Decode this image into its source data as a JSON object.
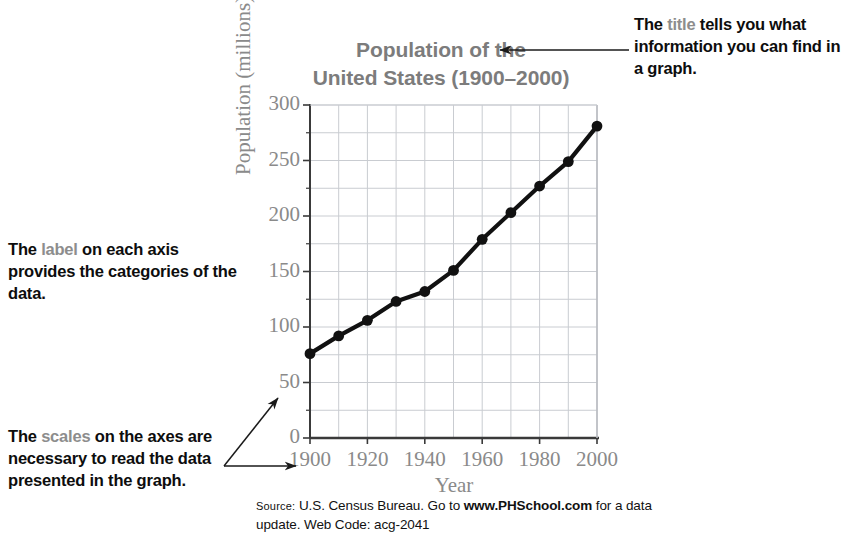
{
  "chart_data": {
    "type": "line",
    "title": "Population of the United States (1900–2000)",
    "title_line1": "Population of the",
    "title_line2": "United States (1900–2000)",
    "xlabel": "Year",
    "ylabel": "Population (millions)",
    "x": [
      1900,
      1910,
      1920,
      1930,
      1940,
      1950,
      1960,
      1970,
      1980,
      1990,
      2000
    ],
    "values": [
      76,
      92,
      106,
      123,
      132,
      151,
      179,
      203,
      227,
      249,
      281
    ],
    "series": [
      {
        "name": "U.S. population",
        "values": [
          76,
          92,
          106,
          123,
          132,
          151,
          179,
          203,
          227,
          249,
          281
        ]
      }
    ],
    "xlim": [
      1900,
      2000
    ],
    "ylim": [
      0,
      300
    ],
    "ytick_labels": [
      "0",
      "50",
      "100",
      "150",
      "200",
      "250",
      "300"
    ],
    "ytick_values": [
      0,
      50,
      100,
      150,
      200,
      250,
      300
    ],
    "xtick_labels": [
      "1900",
      "1920",
      "1940",
      "1960",
      "1980",
      "2000"
    ],
    "xtick_values": [
      1900,
      1920,
      1940,
      1960,
      1980,
      2000
    ],
    "y_minor_step": 25,
    "x_minor_step": 10,
    "grid": true,
    "legend": "none",
    "line_color": "#111111",
    "marker": "circle",
    "marker_color": "#111111",
    "grid_color": "#c9ccd1",
    "axis_color": "#3a3a3a"
  },
  "annotations": {
    "title_callout": {
      "prefix": "The ",
      "keyword": "title",
      "rest": " tells you what information you can find in a graph.",
      "arrow": "points-left-to-chart-title"
    },
    "label_callout": {
      "prefix": "The ",
      "keyword": "label",
      "rest": " on each axis provides the categories of the data."
    },
    "scales_callout": {
      "prefix": "The ",
      "keyword": "scales",
      "rest": " on the axes are necessary to read the data presented in the graph.",
      "arrow": "points-right-to-axis-scales"
    }
  },
  "source": {
    "label": "Source:",
    "text_before_link": " U.S. Census Bureau.  Go to ",
    "link": "www.PHSchool.com",
    "text_after_link": " for a data update. Web Code: acg-2041"
  },
  "colors": {
    "keyword_gray": "#8d8d8d",
    "title_gray": "#7c7c7c",
    "axis_gray": "#8a8a8a",
    "data_black": "#111111",
    "grid": "#c9ccd1",
    "text_black": "#0d0d0d"
  }
}
